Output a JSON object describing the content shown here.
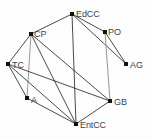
{
  "diagram": {
    "background_color": "#fdfdfd",
    "node_color": "#111111",
    "edge_color_dark": "#2b2b2b",
    "edge_color_gray": "#9a9a9a",
    "label_color": "#444444"
  },
  "nodes": [
    {
      "id": "EdCC",
      "label": "EdCC",
      "x": 72,
      "y": 14,
      "lx": 76,
      "ly": 17
    },
    {
      "id": "CP",
      "label": "CP",
      "x": 31,
      "y": 34,
      "lx": 34,
      "ly": 37
    },
    {
      "id": "PO",
      "label": "PO",
      "x": 105,
      "y": 32,
      "lx": 108,
      "ly": 35
    },
    {
      "id": "TC",
      "label": "TC",
      "x": 8,
      "y": 64,
      "lx": 12,
      "ly": 68
    },
    {
      "id": "AG",
      "label": "AG",
      "x": 126,
      "y": 64,
      "lx": 130,
      "ly": 68
    },
    {
      "id": "A",
      "label": "A",
      "x": 27,
      "y": 98,
      "lx": 31,
      "ly": 103
    },
    {
      "id": "GB",
      "label": "GB",
      "x": 110,
      "y": 101,
      "lx": 114,
      "ly": 105
    },
    {
      "id": "EntCC",
      "label": "EntCC",
      "x": 76,
      "y": 124,
      "lx": 80,
      "ly": 128
    }
  ],
  "edges": [
    {
      "from": "CP",
      "to": "EdCC",
      "x1": 31,
      "y1": 34,
      "x2": 72,
      "y2": 14,
      "style": "dark"
    },
    {
      "from": "EdCC",
      "to": "PO",
      "x1": 72,
      "y1": 14,
      "x2": 105,
      "y2": 32,
      "style": "dark"
    },
    {
      "from": "EdCC",
      "to": "AG",
      "x1": 72,
      "y1": 14,
      "x2": 126,
      "y2": 64,
      "style": "dark"
    },
    {
      "from": "PO",
      "to": "AG",
      "x1": 105,
      "y1": 32,
      "x2": 126,
      "y2": 64,
      "style": "dark"
    },
    {
      "from": "PO",
      "to": "GB",
      "x1": 105,
      "y1": 32,
      "x2": 110,
      "y2": 101,
      "style": "gray"
    },
    {
      "from": "EdCC",
      "to": "EntCC",
      "x1": 72,
      "y1": 14,
      "x2": 76,
      "y2": 124,
      "style": "dark"
    },
    {
      "from": "CP",
      "to": "TC",
      "x1": 31,
      "y1": 34,
      "x2": 8,
      "y2": 64,
      "style": "dark"
    },
    {
      "from": "CP",
      "to": "A",
      "x1": 31,
      "y1": 34,
      "x2": 27,
      "y2": 98,
      "style": "gray"
    },
    {
      "from": "CP",
      "to": "EntCC",
      "x1": 31,
      "y1": 34,
      "x2": 76,
      "y2": 124,
      "style": "dark"
    },
    {
      "from": "CP",
      "to": "GB",
      "x1": 31,
      "y1": 34,
      "x2": 110,
      "y2": 101,
      "style": "dark"
    },
    {
      "from": "TC",
      "to": "A",
      "x1": 8,
      "y1": 64,
      "x2": 27,
      "y2": 98,
      "style": "dark"
    },
    {
      "from": "TC",
      "to": "EntCC",
      "x1": 8,
      "y1": 64,
      "x2": 76,
      "y2": 124,
      "style": "dark"
    },
    {
      "from": "TC",
      "to": "GB",
      "x1": 8,
      "y1": 64,
      "x2": 110,
      "y2": 101,
      "style": "dark"
    },
    {
      "from": "A",
      "to": "EntCC",
      "x1": 27,
      "y1": 98,
      "x2": 76,
      "y2": 124,
      "style": "dark"
    },
    {
      "from": "GB",
      "to": "EntCC",
      "x1": 110,
      "y1": 101,
      "x2": 76,
      "y2": 124,
      "style": "dark"
    }
  ]
}
